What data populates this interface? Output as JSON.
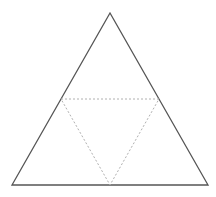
{
  "diagram": {
    "type": "triangle-with-medial-triangle",
    "canvas": {
      "width": 216,
      "height": 197
    },
    "outer_triangle": {
      "points": [
        [
          110,
          13
        ],
        [
          12,
          185
        ],
        [
          208,
          185
        ]
      ],
      "stroke": "#555555",
      "stroke_width": 1.3
    },
    "medial_triangle": {
      "points": [
        [
          61,
          99
        ],
        [
          159,
          99
        ],
        [
          110,
          185
        ]
      ],
      "stroke": "#b0b0b0",
      "stroke_width": 1,
      "dash": "2,2"
    },
    "background": "#ffffff"
  }
}
